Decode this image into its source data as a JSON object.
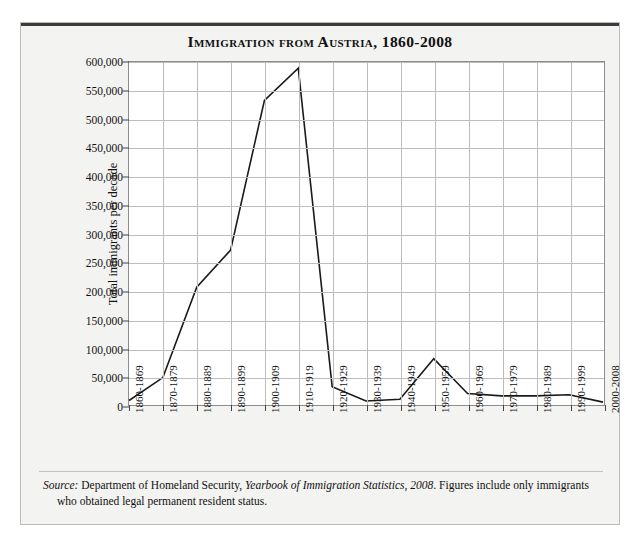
{
  "figure": {
    "title": "Immigration from Austria, 1860-2008",
    "source_prefix": "Source:",
    "source_agency": " Department of Homeland Security, ",
    "source_publication": "Yearbook of Immigration Statistics, 2008",
    "source_rest": ". Figures include only immigrants who obtained legal permanent resident status."
  },
  "colors": {
    "page_background": "#ffffff",
    "panel_background": "#f3f3f2",
    "plot_background": "#ffffff",
    "line": "#1a1a1a",
    "gridline": "#bdbdbd",
    "axis": "#8d8d8d",
    "text": "#111111",
    "top_rule": "#3b3b3b"
  },
  "chart_data": {
    "type": "line",
    "title": "Immigration from Austria, 1860-2008",
    "xlabel": "",
    "ylabel": "Total immigrants per decade",
    "ylim": [
      0,
      600000
    ],
    "ytick_step": 50000,
    "grid": true,
    "legend": false,
    "categories": [
      "1860-1869",
      "1870-1879",
      "1880-1889",
      "1890-1899",
      "1900-1909",
      "1910-1919",
      "1920-1929",
      "1930-1939",
      "1940-1949",
      "1950-1959",
      "1960-1969",
      "1970-1979",
      "1980-1989",
      "1990-1999",
      "2000-2008"
    ],
    "values": [
      7800,
      48000,
      206000,
      271000,
      533000,
      589000,
      32000,
      7000,
      10000,
      81000,
      20000,
      16000,
      16000,
      18000,
      5000
    ],
    "ytick_labels": [
      "0",
      "50,000",
      "100,000",
      "150,000",
      "200,000",
      "250,000",
      "300,000",
      "350,000",
      "400,000",
      "450,000",
      "500,000",
      "550,000",
      "600,000"
    ]
  }
}
